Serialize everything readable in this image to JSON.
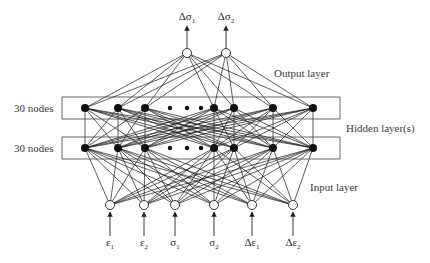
{
  "colors": {
    "edge": "#1a1a1a",
    "hidden_node": "#111111",
    "io_node_fill": "#ffffff",
    "box": "#444444",
    "text": "#3a3a3a"
  },
  "labels": {
    "output_layer": "Output layer",
    "hidden_layers": "Hidden layer(s)",
    "input_layer": "Input layer",
    "hidden_top_count": "30 nodes",
    "hidden_bottom_count": "30 nodes"
  },
  "layers": {
    "output": {
      "y": 53,
      "nodes": [
        {
          "x": 187,
          "symbol": "Δσ",
          "sub": "1"
        },
        {
          "x": 226,
          "symbol": "Δσ",
          "sub": "2"
        }
      ]
    },
    "hidden_top": {
      "y": 108,
      "box": {
        "x": 62,
        "y": 97,
        "w": 278,
        "h": 22
      },
      "nodes_x": [
        85,
        118,
        145,
        214,
        234,
        273,
        313
      ],
      "ellipsis_x": [
        170,
        187,
        201
      ]
    },
    "hidden_bottom": {
      "y": 148,
      "box": {
        "x": 62,
        "y": 137,
        "w": 278,
        "h": 22
      },
      "nodes_x": [
        85,
        118,
        145,
        214,
        234,
        273,
        313
      ],
      "ellipsis_x": [
        170,
        187,
        201
      ]
    },
    "input": {
      "y": 205,
      "nodes": [
        {
          "x": 110,
          "symbol": "ε",
          "sub": "1"
        },
        {
          "x": 144,
          "symbol": "ε",
          "sub": "2"
        },
        {
          "x": 175,
          "symbol": "σ",
          "sub": "1"
        },
        {
          "x": 214,
          "symbol": "σ",
          "sub": "2"
        },
        {
          "x": 252,
          "symbol": "Δε",
          "sub": "1"
        },
        {
          "x": 293,
          "symbol": "Δε",
          "sub": "2"
        }
      ]
    }
  }
}
